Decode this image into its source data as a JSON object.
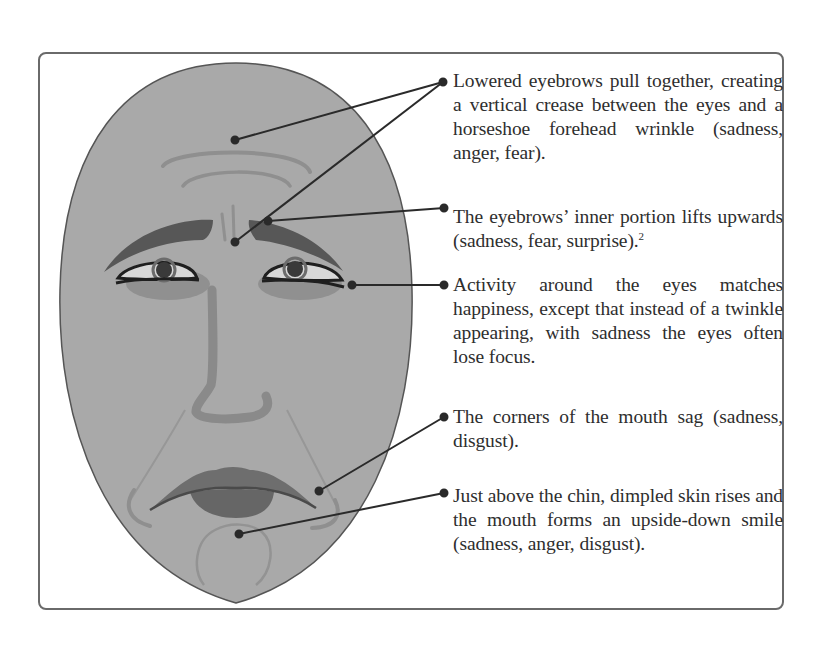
{
  "figure": {
    "colors": {
      "border": "#6a6a6a",
      "face_fill": "#a9a9a9",
      "face_outline": "#555555",
      "feature_dark": "#575757",
      "feature_mid": "#8a8a8a",
      "wrinkle": "#8f8f8f",
      "leader_line": "#2a2a2a",
      "text": "#2e2e2e"
    }
  },
  "callouts": [
    {
      "id": "lowered-eyebrows",
      "text": "Lowered eyebrows pull together, creating a vertical crease between the eyes and a horseshoe forehead wrinkle (sadness, anger, fear)."
    },
    {
      "id": "inner-brow-lift",
      "text": "The eyebrows’ inner portion lifts upwards (sadness, fear, surprise).",
      "footnote": "2"
    },
    {
      "id": "eye-activity",
      "text": "Activity around the eyes matches happiness, except that instead of a twinkle appearing, with sadness the eyes often lose focus."
    },
    {
      "id": "mouth-corners",
      "text": "The corners of the mouth sag (sadness, disgust)."
    },
    {
      "id": "chin-dimple",
      "text": "Just above the chin, dimpled skin rises and the mouth forms an upside-down smile (sadness, anger, disgust)."
    }
  ]
}
